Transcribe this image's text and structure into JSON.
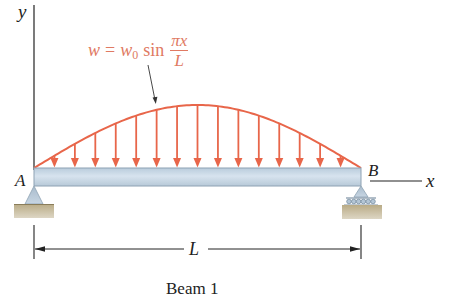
{
  "diagram": {
    "type": "simply-supported beam with sinusoidal distributed load",
    "axes": {
      "y_label": "y",
      "x_label": "x"
    },
    "load": {
      "formula_lhs": "w",
      "formula_eq": "=",
      "formula_w": "w",
      "formula_sub": "0",
      "formula_fn": "sin",
      "formula_num": "πx",
      "formula_den": "L",
      "arrow_count": 15
    },
    "supports": {
      "left_label": "A",
      "right_label": "B",
      "left_type": "pin",
      "right_type": "roller"
    },
    "dimension": {
      "label": "L"
    },
    "caption": "Beam 1",
    "colors": {
      "load": "#e8664a",
      "formula": "#e07a63",
      "beam_fill": "#c8d8e6",
      "beam_stroke": "#8ea2b3",
      "ground": "#c9bfa4",
      "ink": "#222222"
    }
  }
}
